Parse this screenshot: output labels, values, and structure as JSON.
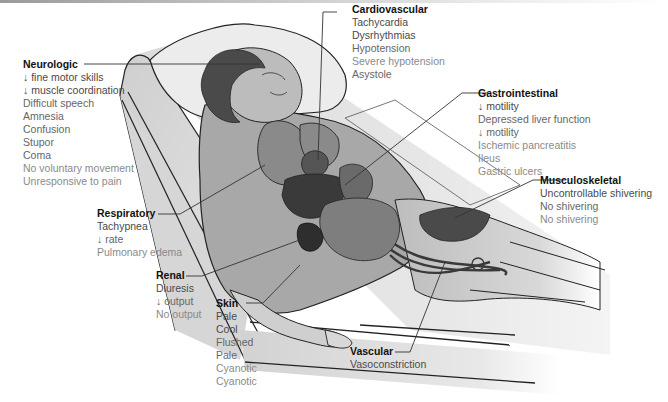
{
  "diagram": {
    "severity_colors": {
      "mild": "#4a4a4a",
      "moderate": "#666666",
      "severe": "#8a8a8a"
    }
  },
  "groups": {
    "neurologic": {
      "title": "Neurologic",
      "items": [
        {
          "text": "↓ fine motor skills",
          "level": "mild"
        },
        {
          "text": "↓ muscle coordination",
          "level": "mild"
        },
        {
          "text": "Difficult speech",
          "level": "moderate"
        },
        {
          "text": "Amnesia",
          "level": "moderate"
        },
        {
          "text": "Confusion",
          "level": "moderate"
        },
        {
          "text": "Stupor",
          "level": "moderate"
        },
        {
          "text": "Coma",
          "level": "moderate"
        },
        {
          "text": "No voluntary movement",
          "level": "severe"
        },
        {
          "text": "Unresponsive to pain",
          "level": "severe"
        }
      ]
    },
    "cardiovascular": {
      "title": "Cardiovascular",
      "items": [
        {
          "text": "Tachycardia",
          "level": "mild"
        },
        {
          "text": "Dysrhythmias",
          "level": "mild"
        },
        {
          "text": "Hypotension",
          "level": "moderate"
        },
        {
          "text": "Severe hypotension",
          "level": "severe"
        },
        {
          "text": "Asystole",
          "level": "severe"
        }
      ]
    },
    "gastrointestinal": {
      "title": "Gastrointestinal",
      "items": [
        {
          "text": "↓ motility",
          "level": "mild"
        },
        {
          "text": "Depressed liver function",
          "level": "moderate"
        },
        {
          "text": "↓ motility",
          "level": "moderate"
        },
        {
          "text": "Ischemic pancreatitis",
          "level": "severe"
        },
        {
          "text": "Ileus",
          "level": "severe"
        },
        {
          "text": "Gastric ulcers",
          "level": "severe"
        }
      ]
    },
    "musculoskeletal": {
      "title": "Musculoskeletal",
      "items": [
        {
          "text": "Uncontrollable shivering",
          "level": "mild"
        },
        {
          "text": "No shivering",
          "level": "moderate"
        },
        {
          "text": "No shivering",
          "level": "severe"
        }
      ]
    },
    "respiratory": {
      "title": "Respiratory",
      "items": [
        {
          "text": "Tachypnea",
          "level": "mild"
        },
        {
          "text": "↓ rate",
          "level": "moderate"
        },
        {
          "text": "Pulmonary edema",
          "level": "severe"
        }
      ]
    },
    "renal": {
      "title": "Renal",
      "items": [
        {
          "text": "Diuresis",
          "level": "mild"
        },
        {
          "text": "↓ output",
          "level": "moderate"
        },
        {
          "text": "No output",
          "level": "severe"
        }
      ]
    },
    "skin": {
      "title": "Skin",
      "items": [
        {
          "text": "Pale",
          "level": "mild"
        },
        {
          "text": "Cool",
          "level": "mild"
        },
        {
          "text": "Flushed",
          "level": "moderate"
        },
        {
          "text": "Pale",
          "level": "moderate"
        },
        {
          "text": "Cyanotic",
          "level": "severe"
        },
        {
          "text": "Cyanotic",
          "level": "severe"
        }
      ]
    },
    "vascular": {
      "title": "Vascular",
      "items": [
        {
          "text": "Vasoconstriction",
          "level": "mild"
        }
      ]
    }
  }
}
